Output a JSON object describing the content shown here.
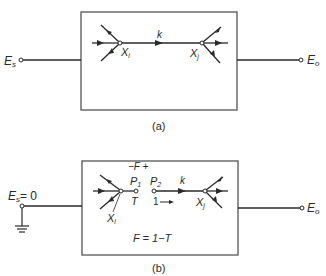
{
  "figure_a": {
    "input_label": "E",
    "input_sub": "s",
    "output_label": "E",
    "output_sub": "o",
    "node_i": "X",
    "node_i_sub": "i",
    "node_j": "X",
    "node_j_sub": "j",
    "branch_gain": "k",
    "caption": "(a)"
  },
  "figure_b": {
    "input_label": "E",
    "input_sub": "s",
    "input_value": "= 0",
    "output_label": "E",
    "output_sub": "o",
    "node_i": "X",
    "node_i_sub": "i",
    "node_j": "X",
    "node_j_sub": "j",
    "port_1": "P",
    "port_1_sub": "1",
    "port_2": "P",
    "port_2_sub": "2",
    "return_label": "T",
    "unit_source": "1",
    "branch_gain": "k",
    "return_difference": "−F +",
    "equation": "F = 1−T",
    "caption": "(b)"
  },
  "colors": {
    "ink": "#2a2a2a",
    "box": "#555555",
    "background": "#ffffff"
  }
}
